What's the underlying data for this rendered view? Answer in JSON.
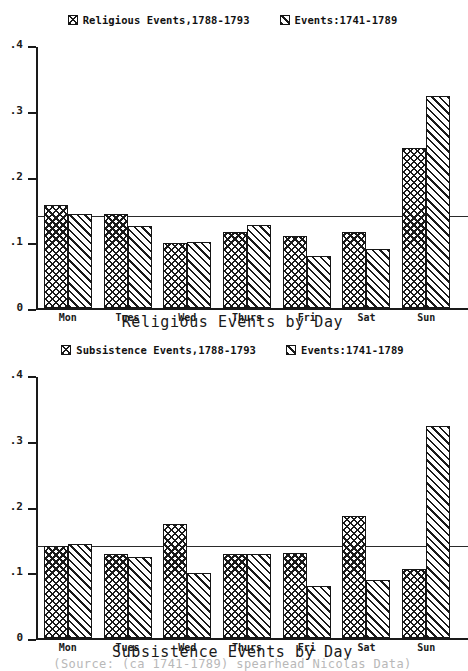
{
  "source_note": "(Source: (ca 1741-1789) spearhead Nicolas Data)",
  "charts": [
    {
      "id": "religious",
      "title": "Religious Events by Day",
      "legend": [
        {
          "label": "Religious Events,1788-1793",
          "pattern": "crosshatch"
        },
        {
          "label": "Events:1741-1789",
          "pattern": "diagonal"
        }
      ],
      "yticks": [
        "0",
        ".1",
        ".2",
        ".3",
        ".4"
      ]
    },
    {
      "id": "subsistence",
      "title": "Subsistence Events by Day",
      "legend": [
        {
          "label": "Subsistence Events,1788-1793",
          "pattern": "crosshatch"
        },
        {
          "label": "Events:1741-1789",
          "pattern": "diagonal"
        }
      ],
      "yticks": [
        "0",
        ".1",
        ".2",
        ".3",
        ".4"
      ]
    }
  ],
  "chart_data": [
    {
      "type": "bar",
      "title": "Religious Events by Day",
      "xlabel": "",
      "ylabel": "",
      "ylim": [
        0,
        0.4
      ],
      "ytick_values": [
        0,
        0.1,
        0.2,
        0.3,
        0.4
      ],
      "ytick_labels": [
        "0",
        ".1",
        ".2",
        ".3",
        ".4"
      ],
      "grid": false,
      "legend_position": "top-center",
      "reference_line": 0.143,
      "categories": [
        "Mon",
        "Tues",
        "Wed",
        "Thurs",
        "Fri",
        "Sat",
        "Sun"
      ],
      "series": [
        {
          "name": "Religious Events,1788-1793",
          "pattern": "crosshatch",
          "values": [
            0.157,
            0.143,
            0.099,
            0.115,
            0.11,
            0.116,
            0.243
          ]
        },
        {
          "name": "Events:1741-1789",
          "pattern": "diagonal",
          "values": [
            0.143,
            0.124,
            0.1,
            0.127,
            0.079,
            0.089,
            0.322
          ]
        }
      ]
    },
    {
      "type": "bar",
      "title": "Subsistence Events by Day",
      "xlabel": "",
      "ylabel": "",
      "ylim": [
        0,
        0.4
      ],
      "ytick_values": [
        0,
        0.1,
        0.2,
        0.3,
        0.4
      ],
      "ytick_labels": [
        "0",
        ".1",
        ".2",
        ".3",
        ".4"
      ],
      "grid": false,
      "legend_position": "top-center",
      "reference_line": 0.143,
      "categories": [
        "Mon",
        "Tues",
        "Wed",
        "Thurs",
        "Fri",
        "Sat",
        "Sun"
      ],
      "series": [
        {
          "name": "Subsistence Events,1788-1793",
          "pattern": "crosshatch",
          "values": [
            0.14,
            0.128,
            0.173,
            0.128,
            0.129,
            0.185,
            0.105
          ]
        },
        {
          "name": "Events:1741-1789",
          "pattern": "diagonal",
          "values": [
            0.143,
            0.123,
            0.099,
            0.128,
            0.079,
            0.088,
            0.322
          ]
        }
      ]
    }
  ]
}
